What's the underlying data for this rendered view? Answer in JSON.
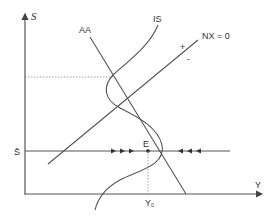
{
  "diagram": {
    "title": "",
    "axes": {
      "y_label": "S",
      "x_label": "Y"
    },
    "curves": {
      "aa_label": "AA",
      "is_label": "IS",
      "nx_label": "NX = 0",
      "nx_plus": "+",
      "nx_minus": "-"
    },
    "fixed_rate_label": "S̄",
    "equilibrium": {
      "point_label": "E",
      "output_label": "Y",
      "output_subscript": "0"
    },
    "arrows": {
      "left_group": "▸ ▸ ▸",
      "right_group": "◂ ◂ ◂"
    },
    "colors": {
      "line": "#555555",
      "text": "#333333",
      "background": "#ffffff"
    }
  }
}
